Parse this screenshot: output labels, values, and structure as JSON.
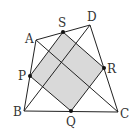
{
  "diagram": {
    "type": "quadrilateral-midpoint-parallelogram",
    "colors": {
      "stroke": "#222222",
      "shade": "#d9d9d9",
      "point": "#111111"
    },
    "vertices": {
      "A": {
        "label": "A",
        "x": 36,
        "y": 40
      },
      "B": {
        "label": "B",
        "x": 24,
        "y": 111
      },
      "C": {
        "label": "C",
        "x": 118,
        "y": 112
      },
      "D": {
        "label": "D",
        "x": 90,
        "y": 25
      }
    },
    "midpoints": {
      "P": {
        "label": "P",
        "x": 30,
        "y": 76
      },
      "Q": {
        "label": "Q",
        "x": 71,
        "y": 111
      },
      "R": {
        "label": "R",
        "x": 104,
        "y": 68
      },
      "S": {
        "label": "S",
        "x": 63,
        "y": 32
      }
    },
    "diagonals": [
      "AC",
      "BD"
    ],
    "shaded_region": "PQRS"
  }
}
